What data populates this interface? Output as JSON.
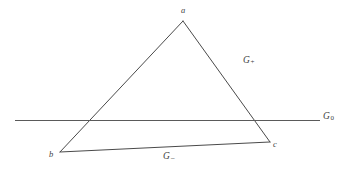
{
  "figure": {
    "background_color": "#ffffff",
    "stroke_color": "#4a4a4a",
    "label_color": "#3f3f3f",
    "width": 349,
    "height": 170
  },
  "vertices": [
    {
      "id": "a",
      "label": "a",
      "x": 183,
      "y": 21,
      "label_x": 181,
      "label_y": 6
    },
    {
      "id": "b",
      "label": "b",
      "x": 60,
      "y": 152,
      "label_x": 49,
      "label_y": 150
    },
    {
      "id": "c",
      "label": "c",
      "x": 270,
      "y": 142,
      "label_x": 273,
      "label_y": 140
    }
  ],
  "edges": [
    {
      "id": "ab",
      "from": "a",
      "to": "b",
      "label": ""
    },
    {
      "id": "ac",
      "from": "a",
      "to": "c",
      "label": "G",
      "sub": "+"
    },
    {
      "id": "bc",
      "from": "b",
      "to": "c",
      "label": "G",
      "sub": "−"
    }
  ],
  "labels": {
    "g_plus": {
      "base": "G",
      "sub": "+",
      "x": 243,
      "y": 56
    },
    "g_minus": {
      "base": "G",
      "sub": "−",
      "x": 163,
      "y": 152
    },
    "g_zero": {
      "base": "G",
      "sub": "0",
      "x": 323,
      "y": 112
    }
  },
  "horizontal_line": {
    "name": "G0",
    "x1": 15,
    "x2": 320,
    "y": 120.5,
    "crosses_edge_ab_at_x": 91,
    "crosses_edge_ac_at_x": 261
  }
}
